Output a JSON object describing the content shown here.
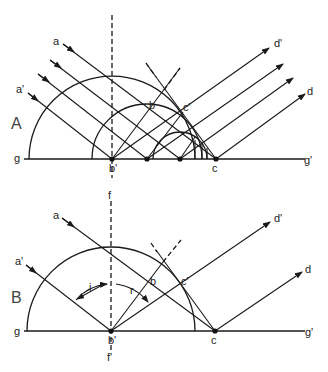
{
  "figure": {
    "panelA": {
      "label": "A",
      "points": {
        "g": "g",
        "g_prime": "g'",
        "b_prime": "b'",
        "b": "b",
        "c": "c",
        "c_prime": "c'",
        "a": "a",
        "a_prime": "a'",
        "d": "d",
        "d_prime": "d'"
      }
    },
    "panelB": {
      "label": "B",
      "points": {
        "g": "g",
        "g_prime": "g'",
        "b_prime": "b'",
        "b": "b",
        "c": "c",
        "c_prime": "c'",
        "a": "a",
        "a_prime": "a'",
        "d": "d",
        "d_prime": "d'",
        "f": "f",
        "f_prime": "f'",
        "i": "i",
        "r": "r"
      }
    },
    "colors": {
      "ink": "#1a1a1a",
      "background": "#ffffff"
    }
  }
}
